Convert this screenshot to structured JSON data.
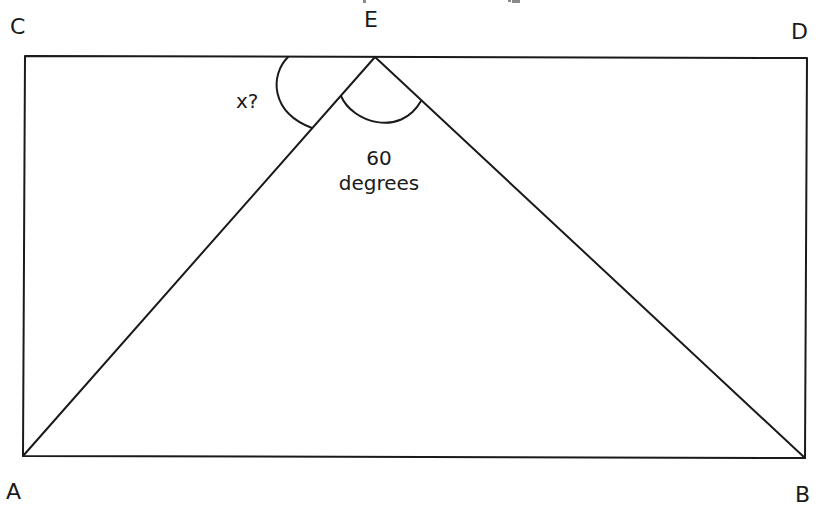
{
  "diagram": {
    "type": "geometry",
    "colors": {
      "stroke": "#1a1a1a",
      "background": "#ffffff"
    },
    "vertices": {
      "C": {
        "label": "C",
        "x": 25,
        "y": 56
      },
      "D": {
        "label": "D",
        "x": 807,
        "y": 58
      },
      "A": {
        "label": "A",
        "x": 23,
        "y": 456
      },
      "B": {
        "label": "B",
        "x": 805,
        "y": 458
      },
      "E": {
        "label": "E",
        "x": 375,
        "y": 57
      }
    },
    "angles": {
      "unknown": {
        "label": "x?",
        "between": [
          "EC",
          "EA"
        ]
      },
      "apex": {
        "value_label": "60",
        "unit_label": "degrees",
        "between": [
          "EA",
          "EB"
        ],
        "value": 60
      }
    }
  }
}
